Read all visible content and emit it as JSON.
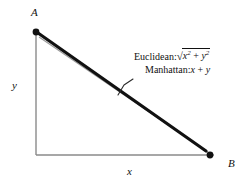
{
  "figure": {
    "background_color": "#ffffff",
    "ink_color": "#111111",
    "axis_color": "#8a8a8a",
    "hypotenuse_color": "#9a9a9a",
    "route_color": "#111111"
  },
  "points": {
    "a_label": "A",
    "b_label": "B"
  },
  "axes": {
    "x_label": "x",
    "y_label": "y"
  },
  "annotations": {
    "euclidean": {
      "name": "Euclidean:",
      "radicand_first_base": "x",
      "radicand_first_exp": "2",
      "operator": "+",
      "radicand_second_base": "y",
      "radicand_second_exp": "2",
      "radical_sign": "√"
    },
    "manhattan": {
      "name": "Manhattan:",
      "first_term": "x",
      "operator": "+",
      "second_term": "y"
    }
  },
  "geometry": {
    "point_a": {
      "x": 36,
      "y": 32
    },
    "point_b": {
      "x": 210,
      "y": 155
    },
    "origin": {
      "x": 36,
      "y": 155
    },
    "x_axis_end": {
      "x": 214,
      "y": 155
    },
    "leader_from": {
      "x": 120,
      "y": 93
    },
    "leader_to": {
      "x": 132,
      "y": 80
    }
  }
}
